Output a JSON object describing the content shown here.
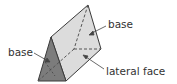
{
  "figure": {
    "labels": {
      "base_left": "base",
      "base_right": "base",
      "lateral_face": "lateral face"
    },
    "colors": {
      "front_base_fill": "#7a7a7a",
      "lateral_face_fill": "#d9d9d9",
      "top_face_fill": "#e6e6e6",
      "edge": "#3a3a3a",
      "hidden_edge": "#555555",
      "label_text": "#333333",
      "leader_line": "#444444"
    }
  }
}
